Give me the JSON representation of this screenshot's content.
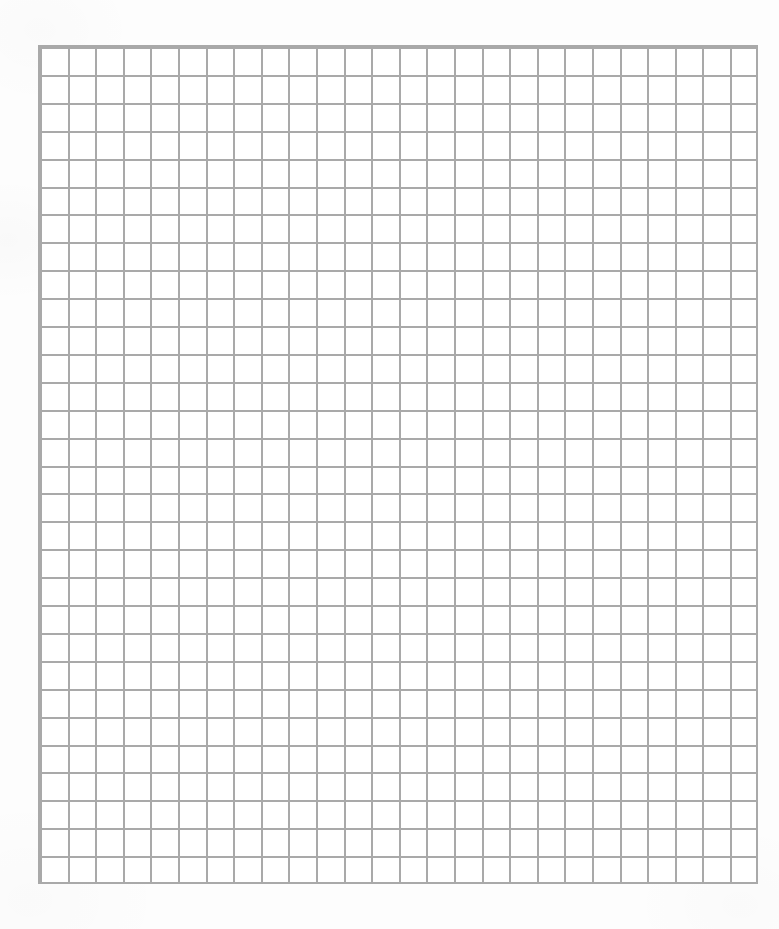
{
  "document": {
    "kind": "grid-paper-sheet",
    "title": "Blank Graph Paper Sheet",
    "page_width": 779,
    "page_height": 929,
    "page_background": "#fdfdfd",
    "content_text": ""
  },
  "grid": {
    "columns": 26,
    "rows": 30,
    "cell_width": 27.6,
    "cell_height": 27.9,
    "line_width": 2,
    "line_color": "#a9a9a9",
    "cell_fill": "#ffffff",
    "offset_x": 40,
    "offset_y": 47,
    "grid_width": 717,
    "grid_height": 837
  },
  "chart_data": {
    "type": "table",
    "title": "",
    "xlabel": "",
    "ylabel": "",
    "categories": [],
    "values": [],
    "columns": 26,
    "rows": 30,
    "cells_total": 780,
    "filled_cells": 0,
    "grid": true,
    "legend": "none"
  }
}
